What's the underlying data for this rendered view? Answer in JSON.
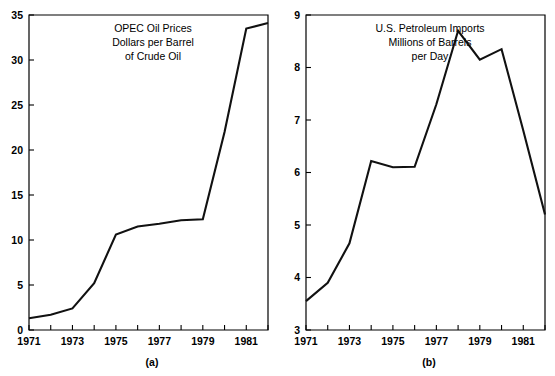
{
  "figure": {
    "background_color": "#ffffff",
    "line_color": "#111111",
    "axis_color": "#000000"
  },
  "panel_a": {
    "caption": "(a)",
    "title_line1": "OPEC Oil Prices",
    "title_line2": "Dollars per Barrel",
    "title_line3": "of Crude Oil"
  },
  "panel_b": {
    "caption": "(b)",
    "title_line1": "U.S. Petroleum Imports",
    "title_line2": "Millions of Barrels",
    "title_line3": "per Day"
  },
  "chart_data": [
    {
      "id": "panel_a",
      "type": "line",
      "title": "OPEC Oil Prices Dollars per Barrel of Crude Oil",
      "xlabel": "",
      "ylabel": "",
      "xlim": [
        1971,
        1982
      ],
      "ylim": [
        0,
        35
      ],
      "yticks": [
        0,
        5,
        10,
        15,
        20,
        25,
        30,
        35
      ],
      "ytick_labels": [
        "0",
        "5",
        "10",
        "15",
        "20",
        "25",
        "30",
        "35"
      ],
      "xticks": [
        1971,
        1972,
        1973,
        1974,
        1975,
        1976,
        1977,
        1978,
        1979,
        1980,
        1981,
        1982
      ],
      "xtick_labels": [
        "1971",
        "",
        "1973",
        "",
        "1975",
        "",
        "1977",
        "",
        "1979",
        "",
        "1981",
        ""
      ],
      "grid": false,
      "legend": "none",
      "x": [
        1971,
        1972,
        1973,
        1974,
        1975,
        1976,
        1977,
        1978,
        1979,
        1980,
        1981,
        1982
      ],
      "values": [
        1.3,
        1.7,
        2.4,
        5.2,
        10.6,
        11.5,
        11.8,
        12.2,
        12.3,
        22.0,
        33.5,
        34.1
      ]
    },
    {
      "id": "panel_b",
      "type": "line",
      "title": "U.S. Petroleum Imports Millions of Barrels per Day",
      "xlabel": "",
      "ylabel": "",
      "xlim": [
        1971,
        1982
      ],
      "ylim": [
        3,
        9
      ],
      "yticks": [
        3,
        4,
        5,
        6,
        7,
        8,
        9
      ],
      "ytick_labels": [
        "3",
        "4",
        "5",
        "6",
        "7",
        "8",
        "9"
      ],
      "xticks": [
        1971,
        1972,
        1973,
        1974,
        1975,
        1976,
        1977,
        1978,
        1979,
        1980,
        1981,
        1982
      ],
      "xtick_labels": [
        "1971",
        "",
        "1973",
        "",
        "1975",
        "",
        "1977",
        "",
        "1979",
        "",
        "1981",
        ""
      ],
      "grid": false,
      "legend": "none",
      "x": [
        1971,
        1972,
        1973,
        1974,
        1975,
        1976,
        1977,
        1978,
        1979,
        1980,
        1981,
        1982
      ],
      "values": [
        3.55,
        3.9,
        4.65,
        6.22,
        6.1,
        6.11,
        7.3,
        8.7,
        8.15,
        8.35,
        6.8,
        5.2
      ]
    }
  ]
}
